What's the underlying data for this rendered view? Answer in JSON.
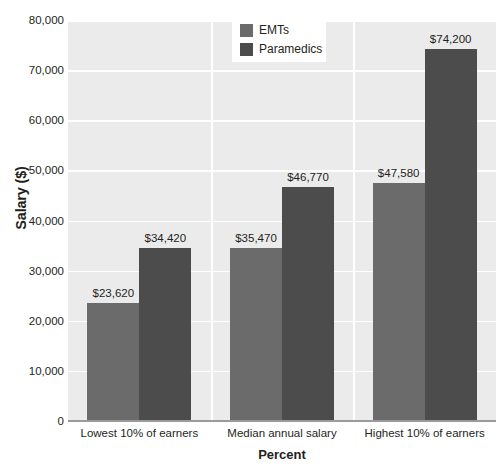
{
  "chart_data": {
    "type": "bar",
    "title": "",
    "xlabel": "Percent",
    "ylabel": "Salary ($)",
    "categories": [
      "Lowest 10% of earners",
      "Median annual salary",
      "Highest 10% of earners"
    ],
    "series": [
      {
        "name": "EMTs",
        "color": "#6b6b6b",
        "values": [
          23620,
          34420,
          47580
        ],
        "labels": [
          "$23,620",
          "$35,470",
          "$47,580"
        ]
      },
      {
        "name": "Paramedics",
        "color": "#4c4c4c",
        "values": [
          34420,
          46770,
          74200
        ],
        "labels": [
          "$34,420",
          "$46,770",
          "$74,200"
        ]
      }
    ],
    "data_labels": [
      [
        "$23,620",
        "$34,420"
      ],
      [
        "$35,470",
        "$46,770"
      ],
      [
        "$47,580",
        "$74,200"
      ]
    ],
    "ylim": [
      0,
      80000
    ],
    "ytick_step": 10000,
    "ytick_labels": [
      "80,000",
      "70,000",
      "60,000",
      "50,000",
      "40,000",
      "30,000",
      "20,000",
      "10,000",
      "0"
    ],
    "ytick_values": [
      80000,
      70000,
      60000,
      50000,
      40000,
      30000,
      20000,
      10000,
      0
    ],
    "grid": "horizontal-and-category-dividers",
    "legend_position": "top-center",
    "plot_background": "#ebebeb",
    "gridline_color": "#ffffff"
  },
  "legend": {
    "entries": [
      {
        "label": "EMTs",
        "color": "#6b6b6b"
      },
      {
        "label": "Paramedics",
        "color": "#4c4c4c"
      }
    ]
  }
}
